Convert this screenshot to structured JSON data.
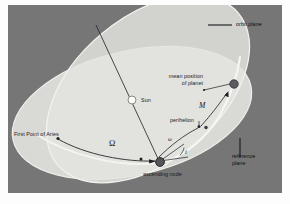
{
  "figure": {
    "background_color": "#767676",
    "page_color": "#ffffff"
  },
  "colors": {
    "background": "#767676",
    "reference_plane": "#d9d9d6",
    "orbit_plane": "#e4e4e0",
    "plane_overlap": "#efefeb",
    "orbit_curve": "#f2f2ee",
    "line": "#2a2a2e",
    "text": "#16161a",
    "sun_fill": "#fbfbf8",
    "planet_fill": "#5d5d61",
    "node_fill": "#5a5a5e"
  },
  "labels": {
    "orbit_plane": "orbit plane",
    "reference_plane_line1": "reference",
    "reference_plane_line2": "plane",
    "mean_position_line1": "mean position",
    "mean_position_line2": "of planet",
    "perihelion": "perihelion",
    "sun": "Sun",
    "first_point_of_aries": "First Point of Aries",
    "ascending_node": "ascending node"
  },
  "symbols": {
    "longitude_ascending_node": "Ω",
    "argument_of_perihelion": "ω",
    "mean_anomaly": "M",
    "inclination": "i"
  },
  "markers": {
    "sun": "sun-marker",
    "planet": "planet-marker",
    "ascending_node": "ascending-node-marker",
    "perihelion": "perihelion-marker",
    "aries": "aries-marker"
  }
}
